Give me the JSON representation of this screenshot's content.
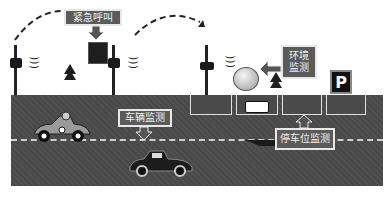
{
  "diagram": {
    "labels": {
      "emergency_call": "紧急呼叫",
      "environment_monitoring": "环境\n监测",
      "environment_monitoring_line1": "环境",
      "environment_monitoring_line2": "监测",
      "vehicle_monitoring": "车辆监测",
      "parking_monitoring": "停车位监测"
    },
    "parking_sign": "P",
    "icons": [
      "street-lamp-icon",
      "wireless-signal-icon",
      "tree-icon",
      "emergency-call-box-icon",
      "environment-sensor-icon",
      "race-car-icon",
      "vintage-car-icon",
      "parked-car-icon",
      "parking-sign-icon"
    ],
    "colors": {
      "road": "#4a4a4a",
      "label_bg": "#5b5b5b",
      "label_border": "#e8e8e8",
      "lane_marking": "#cfcfcf"
    }
  }
}
